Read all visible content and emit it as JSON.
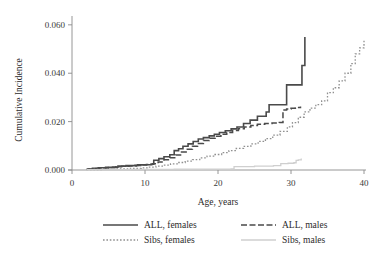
{
  "chart_data": {
    "type": "line",
    "title": "",
    "xlabel": "Age, years",
    "ylabel": "Cumulative Incidence",
    "xlim": [
      0,
      40
    ],
    "ylim": [
      0,
      0.062
    ],
    "xticks": [
      0,
      10,
      20,
      30,
      40
    ],
    "xtick_labels": [
      "0",
      "10",
      "20",
      "30",
      "40"
    ],
    "yticks": [
      0.0,
      0.02,
      0.04,
      0.06
    ],
    "ytick_labels": [
      "0.000",
      "0.020",
      "0.040",
      "0.060"
    ],
    "grid": false,
    "legend_position": "below-center",
    "step_type": "post",
    "series": [
      {
        "name": "ALL, females",
        "style": "solid",
        "color": "#4a4a4a",
        "width": 1.6,
        "x": [
          2.0,
          2.8,
          3.6,
          4.6,
          5.6,
          6.3,
          7.4,
          8.6,
          9.0,
          9.6,
          10.8,
          11.2,
          11.9,
          12.6,
          13.4,
          14.0,
          14.6,
          15.2,
          15.9,
          16.6,
          17.3,
          18.0,
          18.8,
          19.5,
          20.2,
          21.0,
          21.8,
          22.6,
          23.5,
          24.4,
          25.4,
          26.6,
          27.0,
          28.2,
          29.4,
          30.6,
          31.0,
          31.5,
          31.9
        ],
        "y": [
          0.0004,
          0.0007,
          0.0009,
          0.0011,
          0.0012,
          0.0016,
          0.0018,
          0.0019,
          0.0021,
          0.0022,
          0.0024,
          0.004,
          0.0047,
          0.0055,
          0.0063,
          0.008,
          0.0088,
          0.0098,
          0.0108,
          0.0118,
          0.0128,
          0.0134,
          0.0141,
          0.0148,
          0.0155,
          0.0162,
          0.017,
          0.0178,
          0.0192,
          0.0206,
          0.0222,
          0.024,
          0.027,
          0.027,
          0.0352,
          0.0352,
          0.0352,
          0.0432,
          0.055
        ]
      },
      {
        "name": "ALL, males",
        "style": "dashed",
        "color": "#4a4a4a",
        "width": 1.5,
        "x": [
          2.1,
          3.0,
          4.0,
          5.0,
          6.0,
          6.8,
          7.8,
          8.8,
          9.4,
          10.2,
          11.0,
          11.8,
          12.6,
          13.4,
          14.2,
          15.0,
          15.8,
          16.5,
          17.2,
          18.0,
          18.8,
          19.6,
          20.4,
          21.2,
          22.0,
          22.8,
          23.6,
          24.5,
          25.4,
          26.4,
          27.4,
          28.4,
          28.9,
          29.4,
          30.0,
          30.6,
          30.9,
          31.3
        ],
        "y": [
          0.0004,
          0.0006,
          0.0008,
          0.001,
          0.0013,
          0.0015,
          0.0017,
          0.0019,
          0.0021,
          0.0023,
          0.0026,
          0.0033,
          0.0042,
          0.0051,
          0.0062,
          0.0074,
          0.0086,
          0.0098,
          0.011,
          0.0122,
          0.0131,
          0.014,
          0.0148,
          0.0155,
          0.0163,
          0.017,
          0.0178,
          0.0184,
          0.0189,
          0.0192,
          0.0194,
          0.0196,
          0.0248,
          0.0252,
          0.0255,
          0.0256,
          0.0258,
          0.0262
        ]
      },
      {
        "name": "Sibs, females",
        "style": "dotted",
        "color": "#909090",
        "width": 1.3,
        "x": [
          2.0,
          4.0,
          6.0,
          8.0,
          9.5,
          10.5,
          11.5,
          12.5,
          13.5,
          14.5,
          15.5,
          16.5,
          17.5,
          18.5,
          19.5,
          20.5,
          21.5,
          22.5,
          23.5,
          24.5,
          25.5,
          26.5,
          27.5,
          28.5,
          29.5,
          30.2,
          31.0,
          31.8,
          32.6,
          33.4,
          34.2,
          35.0,
          35.8,
          36.6,
          37.4,
          38.2,
          38.8,
          39.4,
          40.0
        ],
        "y": [
          0.0002,
          0.0003,
          0.0005,
          0.0007,
          0.0009,
          0.0012,
          0.0016,
          0.002,
          0.0025,
          0.0031,
          0.0037,
          0.0043,
          0.005,
          0.0057,
          0.0064,
          0.0072,
          0.008,
          0.0089,
          0.0098,
          0.0108,
          0.0118,
          0.013,
          0.0144,
          0.016,
          0.0178,
          0.0196,
          0.0218,
          0.024,
          0.0256,
          0.027,
          0.0286,
          0.032,
          0.034,
          0.0368,
          0.04,
          0.044,
          0.048,
          0.0505,
          0.054
        ]
      },
      {
        "name": "Sibs, males",
        "style": "solid",
        "color": "#cfcfcf",
        "width": 1.3,
        "x": [
          2.0,
          8.0,
          14.0,
          18.0,
          21.8,
          22.2,
          25.0,
          27.6,
          28.6,
          29.6,
          30.4,
          30.7,
          31.0,
          31.4
        ],
        "y": [
          0.0001,
          0.0002,
          0.0003,
          0.0004,
          0.0005,
          0.0014,
          0.0016,
          0.0018,
          0.0026,
          0.0028,
          0.003,
          0.004,
          0.0042,
          0.0048
        ]
      }
    ]
  },
  "legend": {
    "items": [
      {
        "label": "ALL, females",
        "swatch": "solid-dark"
      },
      {
        "label": "ALL, males",
        "swatch": "dashed-dark"
      },
      {
        "label": "Sibs, females",
        "swatch": "dotted-gray"
      },
      {
        "label": "Sibs, males",
        "swatch": "solid-lightgray"
      }
    ]
  },
  "colors": {
    "all_series": "#4a4a4a",
    "sibs_females": "#909090",
    "sibs_males": "#cfcfcf",
    "axis": "#8a8a8a",
    "text": "#2b2b2b",
    "background": "#ffffff"
  }
}
